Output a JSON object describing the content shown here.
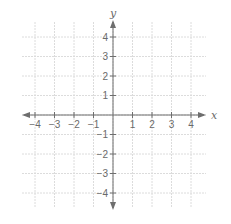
{
  "diagram": {
    "type": "coordinate-plane",
    "x_axis": {
      "label": "x",
      "range": [
        -4,
        4
      ],
      "ticks": [
        -4,
        -3,
        -2,
        -1,
        1,
        2,
        3,
        4
      ],
      "tick_labels": [
        "−4",
        "−3",
        "−2",
        "−1",
        "1",
        "2",
        "3",
        "4"
      ]
    },
    "y_axis": {
      "label": "y",
      "range": [
        -4,
        4
      ],
      "ticks": [
        4,
        3,
        2,
        1,
        -1,
        -2,
        -3,
        -4
      ],
      "tick_labels": [
        "4",
        "3",
        "2",
        "1",
        "−1",
        "−2",
        "−3",
        "−4"
      ]
    },
    "grid": true,
    "colors": {
      "axis": "#6e6e6e",
      "grid": "#dcdcdc",
      "text": "#6a6a6a"
    }
  }
}
